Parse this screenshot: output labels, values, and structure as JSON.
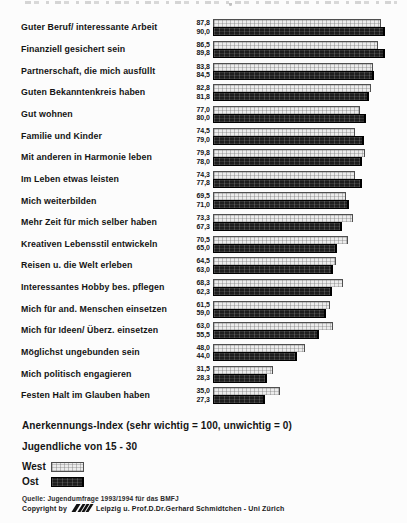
{
  "chart_data": {
    "type": "bar",
    "orientation": "horizontal",
    "categories": [
      "Guter Beruf/ interessante Arbeit",
      "Finanziell gesichert sein",
      "Partnerschaft, die mich ausfüllt",
      "Guten Bekanntenkreis haben",
      "Gut wohnen",
      "Familie und Kinder",
      "Mit anderen in Harmonie leben",
      "Im Leben etwas leisten",
      "Mich weiterbilden",
      "Mehr Zeit für mich selber haben",
      "Kreativen Lebensstil entwickeln",
      "Reisen u. die Welt erleben",
      "Interessantes Hobby bes. pflegen",
      "Mich für and. Menschen einsetzen",
      "Mich für Ideen/ Überz. einsetzen",
      "Möglichst ungebunden sein",
      "Mich politisch engagieren",
      "Festen Halt im Glauben haben"
    ],
    "series": [
      {
        "name": "West",
        "values": [
          87.8,
          86.5,
          83.8,
          82.8,
          77.0,
          74.5,
          79.8,
          74.3,
          69.5,
          73.3,
          70.5,
          64.5,
          68.3,
          61.5,
          63.0,
          48.0,
          31.5,
          35.0
        ]
      },
      {
        "name": "Ost",
        "values": [
          90.0,
          89.8,
          84.5,
          81.8,
          80.0,
          79.0,
          78.0,
          77.8,
          71.0,
          67.3,
          65.0,
          63.0,
          62.3,
          59.0,
          55.5,
          44.0,
          28.3,
          27.3
        ]
      }
    ],
    "value_label_format": "decimal-comma",
    "xlim": [
      0,
      100
    ],
    "grid": false,
    "legend_position": "bottom-left",
    "xlabel": "",
    "ylabel": ""
  },
  "notes": {
    "axis": "Anerkennungs-Index (sehr wichtig = 100, unwichtig = 0)",
    "population": "Jugendliche von 15 - 30"
  },
  "legend": {
    "west": "West",
    "ost": "Ost"
  },
  "footer": {
    "source": "Quelle: Jugendumfrage 1993/1994 für das BMFJ",
    "copyright_prefix": "Copyright by",
    "copyright_suffix": "Leipzig u. Prof.D.Dr.Gerhard Schmidtchen - Uni Zürich"
  },
  "colors": {
    "west_fill": "#ececec",
    "west_hatch": "#6e6e6e",
    "ost_fill": "#1e1e1e",
    "bar_border": "#4f4f4f",
    "text": "#141414",
    "background": "#fcfcfc"
  }
}
